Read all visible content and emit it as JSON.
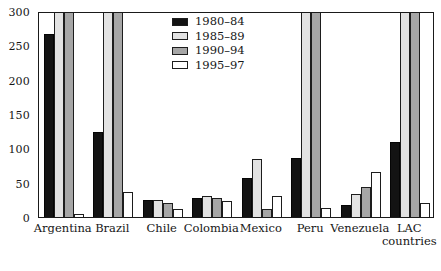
{
  "chart_data": {
    "type": "bar",
    "title": "",
    "subtitle": "",
    "xlabel": "",
    "ylabel": "",
    "ylim": [
      0,
      300
    ],
    "ytick_labels": [
      "0",
      "50",
      "100",
      "150",
      "200",
      "250",
      "300"
    ],
    "ytick_values": [
      0,
      50,
      100,
      150,
      200,
      250,
      300
    ],
    "grid": false,
    "legend_position": "top-center",
    "clipped_at_max": true,
    "categories": [
      "Argentina",
      "Brazil",
      "Chile",
      "Colombia",
      "Mexico",
      "Peru",
      "Venezuela",
      "LAC\ncountries"
    ],
    "series": [
      {
        "name": "1980–84",
        "color": "#131313",
        "values": [
          267,
          124,
          25,
          28,
          57,
          86,
          17,
          109
        ]
      },
      {
        "name": "1985–89",
        "color": "#e2e2e2",
        "values": [
          300,
          300,
          25,
          30,
          85,
          300,
          33,
          300
        ]
      },
      {
        "name": "1990–94",
        "color": "#a6a6a6",
        "values": [
          300,
          300,
          21,
          28,
          12,
          300,
          43,
          300
        ]
      },
      {
        "name": "1995–97",
        "color": "#ffffff",
        "values": [
          5,
          36,
          12,
          23,
          30,
          13,
          65,
          20
        ]
      }
    ]
  },
  "legend": {
    "entries": [
      {
        "label": "1980–84"
      },
      {
        "label": "1985–89"
      },
      {
        "label": "1990–94"
      },
      {
        "label": "1995–97"
      }
    ]
  }
}
